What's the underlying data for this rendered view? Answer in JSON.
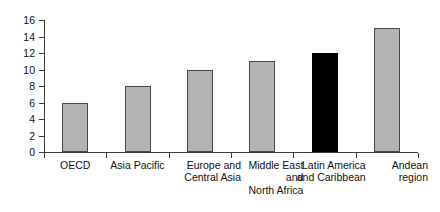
{
  "chart_data": {
    "type": "bar",
    "title": "",
    "subtitle": "",
    "xlabel": "",
    "ylabel": "",
    "ylim": [
      0,
      16
    ],
    "ytick_step": 2,
    "yticks": [
      0,
      2,
      4,
      6,
      8,
      10,
      12,
      14,
      16
    ],
    "grid": false,
    "legend": "none",
    "categories": [
      "OECD",
      "Asia Pacific",
      "Europe and\nCentral Asia",
      "Middle East\nand\nNorth Africa",
      "Latin America\nand Caribbean",
      "Andean\nregion"
    ],
    "values": [
      6.0,
      8.0,
      9.9,
      11.0,
      12.0,
      15.0
    ],
    "bar_colors": [
      "#b4b4b4",
      "#b4b4b4",
      "#b4b4b4",
      "#b4b4b4",
      "#000000",
      "#b4b4b4"
    ],
    "highlighted_category": "Latin America and Caribbean",
    "colors": {
      "bar_fill": "#b4b4b4",
      "bar_border": "#4a4a4a",
      "highlight_fill": "#000000",
      "axis": "#3a3a3a",
      "background": "#ffffff",
      "text": "#111111"
    }
  }
}
